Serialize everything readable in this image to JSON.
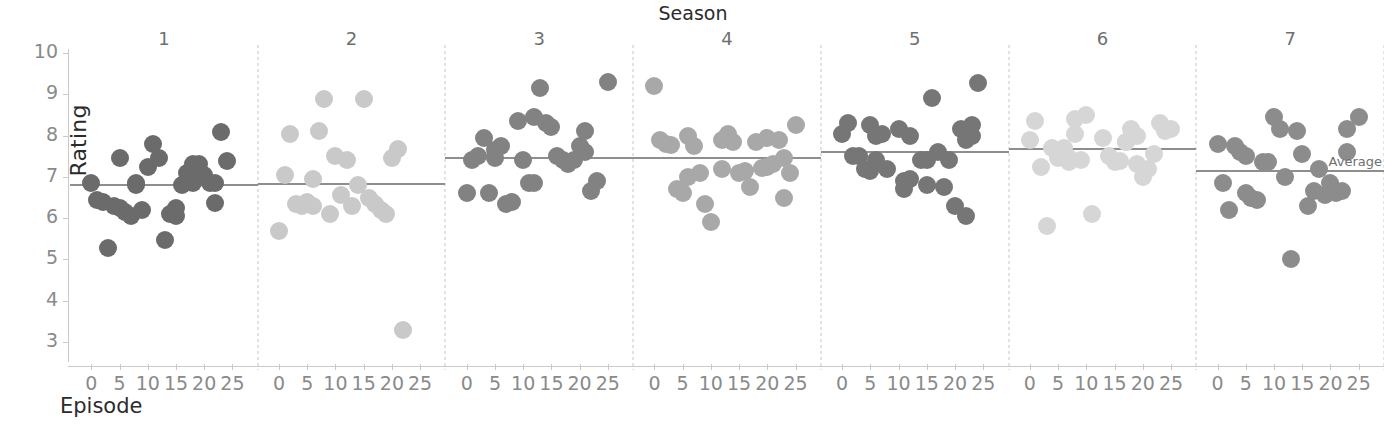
{
  "titles": {
    "chart_group_title": "Season",
    "y_axis_label": "Rating",
    "x_axis_label": "Episode",
    "average_label": "Average"
  },
  "axes": {
    "y_ticks": [
      "10",
      "9",
      "8",
      "7",
      "6",
      "5",
      "4",
      "3"
    ],
    "x_ticks": [
      "0",
      "5",
      "10",
      "15",
      "20",
      "25"
    ]
  },
  "chart_data": {
    "type": "scatter",
    "title": "Season",
    "xlabel": "Episode",
    "ylabel": "Rating",
    "ylim": [
      2.6,
      10.2
    ],
    "xlim": [
      -2,
      27
    ],
    "grid": false,
    "legend": "none",
    "faceted_by": "Season",
    "annotations": [
      {
        "text": "Average",
        "panel": 7,
        "value": 7.17
      }
    ],
    "facets": [
      {
        "season": "1",
        "color": "#6b6b6b",
        "average": 6.83,
        "points": [
          {
            "episode": 0,
            "rating": 6.85
          },
          {
            "episode": 1,
            "rating": 6.45
          },
          {
            "episode": 2,
            "rating": 6.4
          },
          {
            "episode": 3,
            "rating": 5.27
          },
          {
            "episode": 4,
            "rating": 6.3
          },
          {
            "episode": 5,
            "rating": 7.45
          },
          {
            "episode": 5,
            "rating": 6.25
          },
          {
            "episode": 6,
            "rating": 6.15
          },
          {
            "episode": 7,
            "rating": 6.05
          },
          {
            "episode": 8,
            "rating": 6.8
          },
          {
            "episode": 8,
            "rating": 6.85
          },
          {
            "episode": 9,
            "rating": 6.2
          },
          {
            "episode": 10,
            "rating": 7.25
          },
          {
            "episode": 11,
            "rating": 7.8
          },
          {
            "episode": 12,
            "rating": 7.45
          },
          {
            "episode": 13,
            "rating": 5.48
          },
          {
            "episode": 14,
            "rating": 6.1
          },
          {
            "episode": 15,
            "rating": 6.05
          },
          {
            "episode": 15,
            "rating": 6.25
          },
          {
            "episode": 16,
            "rating": 6.8
          },
          {
            "episode": 17,
            "rating": 7.1
          },
          {
            "episode": 18,
            "rating": 7.3
          },
          {
            "episode": 18,
            "rating": 6.85
          },
          {
            "episode": 19,
            "rating": 7.3
          },
          {
            "episode": 20,
            "rating": 7.05
          },
          {
            "episode": 21,
            "rating": 6.85
          },
          {
            "episode": 22,
            "rating": 6.85
          },
          {
            "episode": 22,
            "rating": 6.37
          },
          {
            "episode": 23,
            "rating": 8.08
          },
          {
            "episode": 24,
            "rating": 7.38
          }
        ]
      },
      {
        "season": "2",
        "color": "#c9c9c9",
        "average": 6.85,
        "points": [
          {
            "episode": 0,
            "rating": 5.68
          },
          {
            "episode": 1,
            "rating": 7.05
          },
          {
            "episode": 2,
            "rating": 8.05
          },
          {
            "episode": 3,
            "rating": 6.35
          },
          {
            "episode": 4,
            "rating": 6.3
          },
          {
            "episode": 5,
            "rating": 6.4
          },
          {
            "episode": 6,
            "rating": 6.95
          },
          {
            "episode": 6,
            "rating": 6.3
          },
          {
            "episode": 7,
            "rating": 8.1
          },
          {
            "episode": 8,
            "rating": 8.88
          },
          {
            "episode": 9,
            "rating": 6.1
          },
          {
            "episode": 10,
            "rating": 7.5
          },
          {
            "episode": 11,
            "rating": 6.55
          },
          {
            "episode": 12,
            "rating": 7.42
          },
          {
            "episode": 13,
            "rating": 6.3
          },
          {
            "episode": 14,
            "rating": 6.8
          },
          {
            "episode": 15,
            "rating": 8.88
          },
          {
            "episode": 16,
            "rating": 6.5
          },
          {
            "episode": 17,
            "rating": 6.35
          },
          {
            "episode": 18,
            "rating": 6.2
          },
          {
            "episode": 19,
            "rating": 6.1
          },
          {
            "episode": 20,
            "rating": 7.45
          },
          {
            "episode": 21,
            "rating": 7.68
          },
          {
            "episode": 22,
            "rating": 3.3
          }
        ]
      },
      {
        "season": "3",
        "color": "#828282",
        "average": 7.47,
        "points": [
          {
            "episode": 0,
            "rating": 6.6
          },
          {
            "episode": 1,
            "rating": 7.4
          },
          {
            "episode": 2,
            "rating": 7.5
          },
          {
            "episode": 3,
            "rating": 7.95
          },
          {
            "episode": 4,
            "rating": 6.6
          },
          {
            "episode": 5,
            "rating": 7.45
          },
          {
            "episode": 5,
            "rating": 7.65
          },
          {
            "episode": 6,
            "rating": 7.75
          },
          {
            "episode": 7,
            "rating": 6.35
          },
          {
            "episode": 8,
            "rating": 6.4
          },
          {
            "episode": 9,
            "rating": 8.35
          },
          {
            "episode": 10,
            "rating": 7.4
          },
          {
            "episode": 11,
            "rating": 6.85
          },
          {
            "episode": 12,
            "rating": 8.45
          },
          {
            "episode": 12,
            "rating": 6.85
          },
          {
            "episode": 13,
            "rating": 9.15
          },
          {
            "episode": 14,
            "rating": 8.3
          },
          {
            "episode": 15,
            "rating": 8.2
          },
          {
            "episode": 16,
            "rating": 7.5
          },
          {
            "episode": 17,
            "rating": 7.4
          },
          {
            "episode": 18,
            "rating": 7.3
          },
          {
            "episode": 19,
            "rating": 7.42
          },
          {
            "episode": 20,
            "rating": 7.75
          },
          {
            "episode": 21,
            "rating": 7.6
          },
          {
            "episode": 21,
            "rating": 8.1
          },
          {
            "episode": 22,
            "rating": 6.65
          },
          {
            "episode": 23,
            "rating": 6.9
          },
          {
            "episode": 25,
            "rating": 9.3
          }
        ]
      },
      {
        "season": "4",
        "color": "#a8a8a8",
        "average": 7.48,
        "points": [
          {
            "episode": 0,
            "rating": 9.2
          },
          {
            "episode": 1,
            "rating": 7.9
          },
          {
            "episode": 2,
            "rating": 7.8
          },
          {
            "episode": 3,
            "rating": 7.78
          },
          {
            "episode": 4,
            "rating": 6.7
          },
          {
            "episode": 5,
            "rating": 6.6
          },
          {
            "episode": 6,
            "rating": 8.0
          },
          {
            "episode": 6,
            "rating": 7.0
          },
          {
            "episode": 7,
            "rating": 7.75
          },
          {
            "episode": 8,
            "rating": 7.1
          },
          {
            "episode": 9,
            "rating": 6.35
          },
          {
            "episode": 10,
            "rating": 5.9
          },
          {
            "episode": 12,
            "rating": 7.9
          },
          {
            "episode": 12,
            "rating": 7.2
          },
          {
            "episode": 13,
            "rating": 8.05
          },
          {
            "episode": 14,
            "rating": 7.85
          },
          {
            "episode": 15,
            "rating": 7.1
          },
          {
            "episode": 16,
            "rating": 7.15
          },
          {
            "episode": 17,
            "rating": 6.75
          },
          {
            "episode": 18,
            "rating": 7.85
          },
          {
            "episode": 19,
            "rating": 7.22
          },
          {
            "episode": 20,
            "rating": 7.95
          },
          {
            "episode": 20,
            "rating": 7.25
          },
          {
            "episode": 21,
            "rating": 7.3
          },
          {
            "episode": 22,
            "rating": 7.9
          },
          {
            "episode": 23,
            "rating": 6.5
          },
          {
            "episode": 23,
            "rating": 7.45
          },
          {
            "episode": 24,
            "rating": 7.1
          },
          {
            "episode": 25,
            "rating": 8.25
          }
        ]
      },
      {
        "season": "5",
        "color": "#767676",
        "average": 7.62,
        "points": [
          {
            "episode": 0,
            "rating": 8.05
          },
          {
            "episode": 1,
            "rating": 8.3
          },
          {
            "episode": 2,
            "rating": 7.5
          },
          {
            "episode": 3,
            "rating": 7.5
          },
          {
            "episode": 4,
            "rating": 7.2
          },
          {
            "episode": 5,
            "rating": 7.15
          },
          {
            "episode": 5,
            "rating": 8.25
          },
          {
            "episode": 6,
            "rating": 7.42
          },
          {
            "episode": 6,
            "rating": 8.0
          },
          {
            "episode": 7,
            "rating": 8.05
          },
          {
            "episode": 8,
            "rating": 7.2
          },
          {
            "episode": 10,
            "rating": 8.15
          },
          {
            "episode": 11,
            "rating": 6.7
          },
          {
            "episode": 11,
            "rating": 6.9
          },
          {
            "episode": 12,
            "rating": 6.95
          },
          {
            "episode": 12,
            "rating": 8.0
          },
          {
            "episode": 14,
            "rating": 7.4
          },
          {
            "episode": 15,
            "rating": 7.4
          },
          {
            "episode": 15,
            "rating": 6.8
          },
          {
            "episode": 16,
            "rating": 8.9
          },
          {
            "episode": 17,
            "rating": 7.6
          },
          {
            "episode": 18,
            "rating": 6.75
          },
          {
            "episode": 19,
            "rating": 7.4
          },
          {
            "episode": 20,
            "rating": 6.3
          },
          {
            "episode": 21,
            "rating": 8.15
          },
          {
            "episode": 22,
            "rating": 6.05
          },
          {
            "episode": 22,
            "rating": 7.9
          },
          {
            "episode": 23,
            "rating": 8.0
          },
          {
            "episode": 23,
            "rating": 8.25
          },
          {
            "episode": 24,
            "rating": 9.28
          }
        ]
      },
      {
        "season": "6",
        "color": "#d6d6d6",
        "average": 7.7,
        "points": [
          {
            "episode": 0,
            "rating": 7.9
          },
          {
            "episode": 1,
            "rating": 8.35
          },
          {
            "episode": 2,
            "rating": 7.25
          },
          {
            "episode": 3,
            "rating": 5.8
          },
          {
            "episode": 4,
            "rating": 7.7
          },
          {
            "episode": 5,
            "rating": 7.55
          },
          {
            "episode": 5,
            "rating": 7.45
          },
          {
            "episode": 6,
            "rating": 7.7
          },
          {
            "episode": 6,
            "rating": 7.5
          },
          {
            "episode": 7,
            "rating": 7.45
          },
          {
            "episode": 7,
            "rating": 7.35
          },
          {
            "episode": 8,
            "rating": 8.05
          },
          {
            "episode": 8,
            "rating": 8.4
          },
          {
            "episode": 9,
            "rating": 7.4
          },
          {
            "episode": 10,
            "rating": 8.5
          },
          {
            "episode": 11,
            "rating": 6.1
          },
          {
            "episode": 13,
            "rating": 7.95
          },
          {
            "episode": 14,
            "rating": 7.5
          },
          {
            "episode": 15,
            "rating": 7.35
          },
          {
            "episode": 16,
            "rating": 7.38
          },
          {
            "episode": 17,
            "rating": 7.85
          },
          {
            "episode": 17,
            "rating": 7.85
          },
          {
            "episode": 18,
            "rating": 8.15
          },
          {
            "episode": 19,
            "rating": 8.0
          },
          {
            "episode": 19,
            "rating": 7.3
          },
          {
            "episode": 20,
            "rating": 7.0
          },
          {
            "episode": 21,
            "rating": 7.2
          },
          {
            "episode": 22,
            "rating": 7.55
          },
          {
            "episode": 23,
            "rating": 8.3
          },
          {
            "episode": 24,
            "rating": 8.1
          },
          {
            "episode": 25,
            "rating": 8.15
          }
        ]
      },
      {
        "season": "7",
        "color": "#8c8c8c",
        "average": 7.17,
        "points": [
          {
            "episode": 0,
            "rating": 7.8
          },
          {
            "episode": 1,
            "rating": 6.85
          },
          {
            "episode": 2,
            "rating": 6.2
          },
          {
            "episode": 3,
            "rating": 7.75
          },
          {
            "episode": 4,
            "rating": 7.6
          },
          {
            "episode": 5,
            "rating": 6.6
          },
          {
            "episode": 5,
            "rating": 7.5
          },
          {
            "episode": 6,
            "rating": 6.5
          },
          {
            "episode": 7,
            "rating": 6.45
          },
          {
            "episode": 8,
            "rating": 7.35
          },
          {
            "episode": 9,
            "rating": 7.35
          },
          {
            "episode": 10,
            "rating": 8.45
          },
          {
            "episode": 11,
            "rating": 8.15
          },
          {
            "episode": 12,
            "rating": 7.0
          },
          {
            "episode": 13,
            "rating": 5.0
          },
          {
            "episode": 14,
            "rating": 8.1
          },
          {
            "episode": 15,
            "rating": 7.55
          },
          {
            "episode": 16,
            "rating": 6.3
          },
          {
            "episode": 17,
            "rating": 6.65
          },
          {
            "episode": 18,
            "rating": 7.2
          },
          {
            "episode": 19,
            "rating": 6.55
          },
          {
            "episode": 20,
            "rating": 6.85
          },
          {
            "episode": 21,
            "rating": 6.6
          },
          {
            "episode": 22,
            "rating": 6.65
          },
          {
            "episode": 23,
            "rating": 7.6
          },
          {
            "episode": 23,
            "rating": 8.15
          },
          {
            "episode": 25,
            "rating": 8.45
          }
        ]
      }
    ]
  }
}
